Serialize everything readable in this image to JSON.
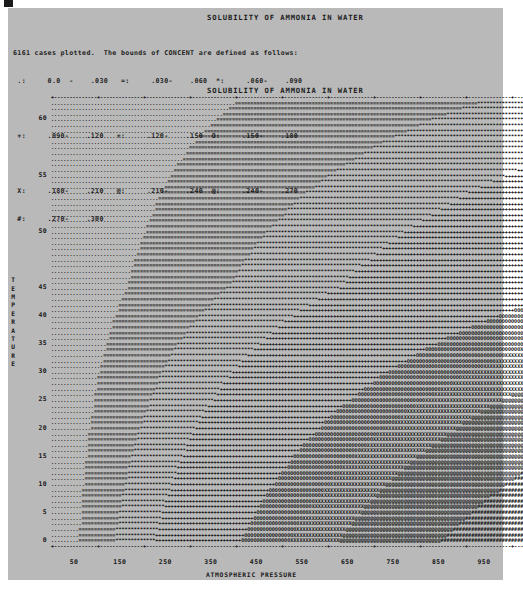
{
  "document": {
    "title_top": "SOLUBILITY OF AMMONIA IN WATER",
    "title_plot": "SOLUBILITY OF AMMONIA IN WATER"
  },
  "legend": {
    "header": "6161 cases plotted.  The bounds of CONCENT are defined as follows:",
    "rows": [
      " .:     0.0  -    .030   =:     .030-    .060  *:     .060-    .090",
      "",
      " +:     .090-    .120   +:     .120-    .150  O:     .150-    .180",
      "",
      " X:     .180-    .210   @:     .210-    .240  @:     .240-    .270",
      " #:     .270-    .300"
    ],
    "entries": [
      {
        "symbol": ".",
        "low": "0.0",
        "high": ".030"
      },
      {
        "symbol": "=",
        "low": ".030",
        "high": ".060"
      },
      {
        "symbol": "*",
        "low": ".060",
        "high": ".090"
      },
      {
        "symbol": "+",
        "low": ".090",
        "high": ".120"
      },
      {
        "symbol": "+",
        "low": ".120",
        "high": ".150"
      },
      {
        "symbol": "O",
        "low": ".150",
        "high": ".180"
      },
      {
        "symbol": "X",
        "low": ".180",
        "high": ".210"
      },
      {
        "symbol": "@",
        "low": ".210",
        "high": ".240"
      },
      {
        "symbol": "@",
        "low": ".240",
        "high": ".270"
      },
      {
        "symbol": "#",
        "low": ".270",
        "high": ".300"
      }
    ],
    "cases_plotted": 6161,
    "variable": "CONCENT"
  },
  "chart_data": {
    "type": "heatmap",
    "title": "SOLUBILITY OF AMMONIA IN WATER",
    "xlabel": "ATMOSPHERIC PRESSURE",
    "ylabel": "TEMPERATURE",
    "xlim": [
      0,
      1000
    ],
    "ylim": [
      0,
      62
    ],
    "grid": false,
    "legend_position": "above-plot",
    "x_ticks": [
      50,
      150,
      250,
      350,
      450,
      550,
      650,
      750,
      850,
      950
    ],
    "y_ticks": [
      60,
      55,
      50,
      45,
      40,
      35,
      30,
      25,
      20,
      15,
      10,
      5,
      0
    ],
    "x_tick_labels": [
      "50",
      "150",
      "250",
      "350",
      "450",
      "550",
      "650",
      "750",
      "850",
      "950"
    ],
    "y_tick_labels": [
      "60",
      "55",
      "50",
      "45",
      "40",
      "35",
      "30",
      "25",
      "20",
      "15",
      "10",
      "5",
      "0"
    ],
    "z_variable": "CONCENT",
    "z_levels": [
      0.0,
      0.03,
      0.06,
      0.09,
      0.12,
      0.15,
      0.18,
      0.21,
      0.24,
      0.27,
      0.3
    ],
    "z_symbols": [
      ".",
      "=",
      "*",
      "+",
      "+",
      "O",
      "X",
      "@",
      "@",
      "#"
    ],
    "cols": 154,
    "rows": 79,
    "row_temperatures": [
      61.5,
      61.0,
      60.5,
      60.0,
      59.5,
      59.0,
      58.5,
      58.0,
      57.5,
      57.0,
      56.5,
      56.0,
      55.5,
      55.0,
      54.5,
      54.0,
      53.5,
      53.0,
      52.5,
      52.0,
      51.5,
      51.0,
      50.5,
      50.0,
      49.5,
      49.0,
      48.5,
      48.0,
      47.5,
      47.0,
      46.5,
      46.0,
      45.5,
      45.0,
      44.0,
      43.0,
      42.0,
      41.0,
      40.0,
      39.0,
      38.0,
      37.0,
      36.0,
      35.0,
      34.0,
      33.0,
      32.0,
      31.0,
      30.0,
      29.0,
      28.0,
      27.0,
      26.0,
      25.0,
      24.0,
      23.0,
      22.0,
      21.0,
      20.0,
      19.0,
      18.0,
      17.0,
      16.0,
      15.0,
      14.0,
      13.0,
      12.0,
      11.0,
      10.0,
      9.0,
      8.0,
      7.0,
      6.0,
      5.0,
      4.0,
      3.0,
      2.0,
      1.0,
      0.0
    ],
    "iso_boundaries_note": "Band edge x-position (0-153 column index) for each symbol transition, per row, generated by the template from the temperature/pressure surface."
  }
}
